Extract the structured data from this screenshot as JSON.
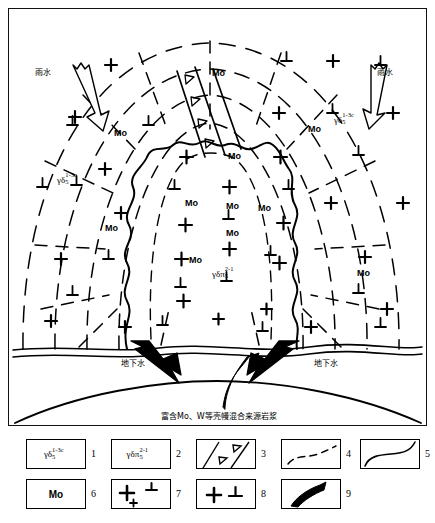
{
  "figure": {
    "type": "geological-cross-section",
    "background_color": "#ffffff",
    "line_color": "#000000"
  },
  "diagram": {
    "rock_unit_labels": [
      {
        "id": "granodiorite-left",
        "prefix": "γδ",
        "sub": "5",
        "sup": "1-3c",
        "x": 55,
        "y": 172
      },
      {
        "id": "granodiorite-right",
        "prefix": "γδ",
        "sub": "5",
        "sup": "1-3c",
        "x": 333,
        "y": 112
      },
      {
        "id": "granodiorite-porphyry-center",
        "prefix": "γδπ",
        "sub": "5",
        "sup": "2-1",
        "x": 212,
        "y": 266
      }
    ],
    "mo_labels": [
      {
        "text": "Mo",
        "x": 210,
        "y": 66
      },
      {
        "text": "Mo",
        "x": 112,
        "y": 126
      },
      {
        "text": "Mo",
        "x": 306,
        "y": 122
      },
      {
        "text": "Mo",
        "x": 226,
        "y": 149
      },
      {
        "text": "Mo",
        "x": 183,
        "y": 196
      },
      {
        "text": "Mo",
        "x": 224,
        "y": 199
      },
      {
        "text": "Mo",
        "x": 256,
        "y": 201
      },
      {
        "text": "Mo",
        "x": 224,
        "y": 226
      },
      {
        "text": "Mo",
        "x": 187,
        "y": 253
      },
      {
        "text": "Mo",
        "x": 103,
        "y": 221
      },
      {
        "text": "Mo",
        "x": 355,
        "y": 266
      }
    ],
    "water_labels": [
      {
        "text": "雨水",
        "x": 42,
        "y": 66,
        "meaning": "rainwater-left"
      },
      {
        "text": "雨水",
        "x": 382,
        "y": 66,
        "meaning": "rainwater-right"
      },
      {
        "text": "地下水",
        "x": 125,
        "y": 357,
        "meaning": "groundwater-left"
      },
      {
        "text": "地下水",
        "x": 318,
        "y": 357,
        "meaning": "groundwater-right"
      }
    ],
    "source_label": {
      "text": "富含Mo、W等壳幔混合来源岩浆",
      "x": 165,
      "y": 410,
      "meaning": "magma-rich-in-Mo-W-from-mixed-crust-mantle-source"
    }
  },
  "legend": {
    "items": [
      {
        "number": "1",
        "kind": "unit",
        "prefix": "γδ",
        "sub": "5",
        "sup": "1-3c",
        "label": "granodiorite"
      },
      {
        "number": "2",
        "kind": "unit",
        "prefix": "γδπ",
        "sub": "5",
        "sup": "2-1",
        "label": "granodiorite-porphyry"
      },
      {
        "number": "3",
        "kind": "dike-with-triangles",
        "label": "dike"
      },
      {
        "number": "4",
        "kind": "dashed-contour",
        "label": "alteration-zone-boundary"
      },
      {
        "number": "5",
        "kind": "solid-curve",
        "label": "intrusion-contact"
      },
      {
        "number": "6",
        "kind": "mo-text",
        "text": "Mo",
        "label": "molybdenum-mineralization"
      },
      {
        "number": "7",
        "kind": "plus-perp-small",
        "label": "sparse-crystal-symbol"
      },
      {
        "number": "8",
        "kind": "plus-perp-large",
        "label": "dense-crystal-symbol"
      },
      {
        "number": "9",
        "kind": "arrow-curved",
        "label": "fluid-flow-direction"
      }
    ]
  }
}
